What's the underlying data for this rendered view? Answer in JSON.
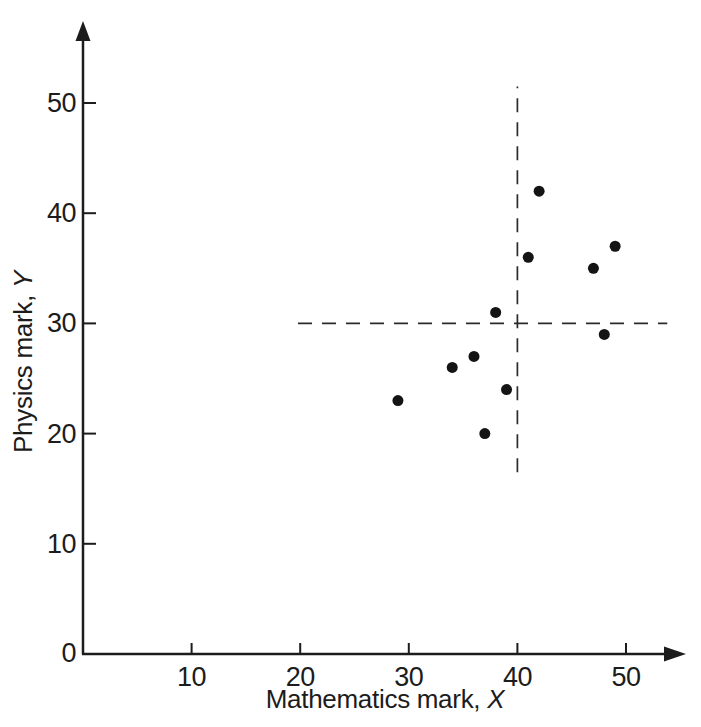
{
  "chart_data": {
    "type": "scatter",
    "title": "",
    "xlabel_text": "Mathematics mark, ",
    "xlabel_var": "X",
    "ylabel_text": "Physics mark, ",
    "ylabel_var": "Y",
    "origin_label": "0",
    "x_ticks": [
      10,
      20,
      30,
      40,
      50
    ],
    "y_ticks": [
      10,
      20,
      30,
      40,
      50
    ],
    "xlim": [
      0,
      55
    ],
    "ylim": [
      0,
      57
    ],
    "grid": false,
    "legend": false,
    "points": [
      {
        "x": 42,
        "y": 42
      },
      {
        "x": 49,
        "y": 37
      },
      {
        "x": 41,
        "y": 36
      },
      {
        "x": 47,
        "y": 35
      },
      {
        "x": 38,
        "y": 31
      },
      {
        "x": 48,
        "y": 29
      },
      {
        "x": 36,
        "y": 27
      },
      {
        "x": 34,
        "y": 26
      },
      {
        "x": 39,
        "y": 24
      },
      {
        "x": 29,
        "y": 23
      },
      {
        "x": 37,
        "y": 20
      }
    ],
    "mean_lines": {
      "x_mean": 40,
      "x_line_from_y": 16.5,
      "x_line_to_y": 51.5,
      "y_mean": 30,
      "y_line_from_x": 19.8,
      "y_line_to_x": 53.8
    },
    "colors": {
      "ink": "#1c1c1c",
      "background": "#ffffff",
      "point": "#141414",
      "dash": "#2a2a2a"
    }
  }
}
